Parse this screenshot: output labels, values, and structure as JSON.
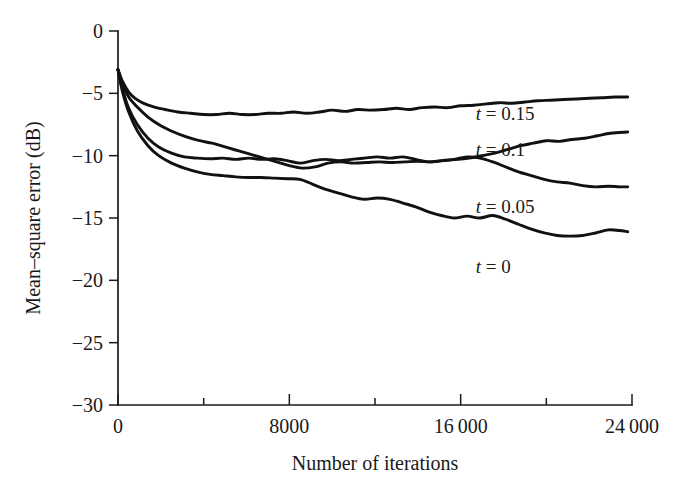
{
  "chart_data": {
    "type": "line",
    "title": "",
    "xlabel": "Number of iterations",
    "ylabel": "Mean–square error (dB)",
    "xlim": [
      0,
      24000
    ],
    "ylim": [
      -30,
      0
    ],
    "grid": false,
    "legend_position": "inline-right",
    "x_ticks": [
      0,
      8000,
      16000,
      24000
    ],
    "x_tick_labels": [
      "0",
      "8000",
      "16 000",
      "24 000"
    ],
    "x_minor_ticks": [
      4000,
      12000,
      20000
    ],
    "y_ticks": [
      0,
      -5,
      -10,
      -15,
      -20,
      -25,
      -30
    ],
    "y_tick_labels": [
      "0",
      "−5",
      "−10",
      "−15",
      "−20",
      "−25",
      "−30"
    ],
    "series": [
      {
        "name": "t = 0.15",
        "label_var": "t",
        "label_eq": "=",
        "label_value": "0.15",
        "label_at": {
          "x": 16700,
          "y": -7.1
        },
        "x": [
          0,
          200,
          500,
          800,
          1200,
          1700,
          2200,
          2800,
          3400,
          4000,
          4600,
          5200,
          5800,
          6400,
          7000,
          7600,
          8200,
          8800,
          9400,
          10000,
          10600,
          11200,
          11800,
          12400,
          13000,
          13600,
          14200,
          14800,
          15400,
          16000,
          16600,
          17200,
          17800,
          18400,
          19000,
          19600,
          20200,
          20800,
          21400,
          22000,
          22600,
          23200,
          23800
        ],
        "y": [
          -3.1,
          -4.0,
          -4.9,
          -5.4,
          -5.8,
          -6.1,
          -6.3,
          -6.5,
          -6.6,
          -6.7,
          -6.7,
          -6.6,
          -6.7,
          -6.7,
          -6.6,
          -6.6,
          -6.5,
          -6.6,
          -6.5,
          -6.35,
          -6.45,
          -6.3,
          -6.35,
          -6.3,
          -6.2,
          -6.3,
          -6.15,
          -6.1,
          -6.15,
          -6.0,
          -5.95,
          -5.85,
          -5.75,
          -5.8,
          -5.7,
          -5.6,
          -5.55,
          -5.5,
          -5.45,
          -5.4,
          -5.35,
          -5.3,
          -5.3
        ]
      },
      {
        "name": "t = 0.1",
        "label_var": "t",
        "label_eq": "=",
        "label_value": "0.1",
        "label_at": {
          "x": 16700,
          "y": -10.0
        },
        "x": [
          0,
          200,
          500,
          900,
          1400,
          2000,
          2600,
          3200,
          3800,
          4400,
          5000,
          5600,
          6200,
          6800,
          7400,
          8000,
          8600,
          9200,
          9800,
          10400,
          11000,
          11600,
          12200,
          12800,
          13400,
          14000,
          14600,
          15200,
          15800,
          16400,
          17000,
          17600,
          18200,
          18800,
          19400,
          20000,
          20600,
          21200,
          21800,
          22400,
          23000,
          23800
        ],
        "y": [
          -3.1,
          -4.2,
          -5.3,
          -6.1,
          -6.9,
          -7.6,
          -8.1,
          -8.5,
          -8.8,
          -9.0,
          -9.3,
          -9.6,
          -9.9,
          -10.2,
          -10.5,
          -10.8,
          -11.0,
          -10.9,
          -10.6,
          -10.5,
          -10.6,
          -10.55,
          -10.5,
          -10.55,
          -10.5,
          -10.45,
          -10.5,
          -10.4,
          -10.3,
          -10.2,
          -10.0,
          -9.8,
          -9.5,
          -9.2,
          -9.0,
          -8.8,
          -8.85,
          -8.7,
          -8.6,
          -8.4,
          -8.2,
          -8.1
        ]
      },
      {
        "name": "t = 0.05",
        "label_var": "t",
        "label_eq": "=",
        "label_value": "0.05",
        "label_at": {
          "x": 16700,
          "y": -14.6
        },
        "x": [
          0,
          200,
          500,
          900,
          1400,
          1900,
          2500,
          3100,
          3700,
          4300,
          4900,
          5500,
          6100,
          6700,
          7300,
          7900,
          8500,
          9100,
          9700,
          10300,
          10900,
          11500,
          12100,
          12700,
          13300,
          13900,
          14500,
          15100,
          15700,
          16300,
          16900,
          17500,
          18100,
          18700,
          19300,
          19900,
          20500,
          21100,
          21700,
          22300,
          22900,
          23400,
          23800
        ],
        "y": [
          -3.1,
          -4.6,
          -6.2,
          -7.5,
          -8.6,
          -9.3,
          -9.8,
          -10.1,
          -10.2,
          -10.25,
          -10.2,
          -10.3,
          -10.2,
          -10.3,
          -10.25,
          -10.4,
          -10.6,
          -10.4,
          -10.3,
          -10.4,
          -10.3,
          -10.2,
          -10.1,
          -10.2,
          -10.1,
          -10.3,
          -10.5,
          -10.4,
          -10.3,
          -10.1,
          -10.2,
          -10.5,
          -10.9,
          -11.3,
          -11.6,
          -11.9,
          -12.1,
          -12.2,
          -12.4,
          -12.5,
          -12.45,
          -12.5,
          -12.5
        ]
      },
      {
        "name": "t = 0",
        "label_var": "t",
        "label_eq": "=",
        "label_value": "0",
        "label_at": {
          "x": 16700,
          "y": -19.4
        },
        "x": [
          0,
          200,
          500,
          900,
          1400,
          1900,
          2500,
          3100,
          3700,
          4300,
          4900,
          5500,
          6100,
          6700,
          7300,
          7900,
          8500,
          9100,
          9700,
          10300,
          10900,
          11500,
          12100,
          12700,
          13300,
          13900,
          14500,
          15100,
          15700,
          16300,
          16900,
          17500,
          18100,
          18700,
          19300,
          19900,
          20500,
          21100,
          21700,
          22300,
          22900,
          23400,
          23800
        ],
        "y": [
          -3.1,
          -4.8,
          -6.5,
          -8.0,
          -9.2,
          -10.0,
          -10.6,
          -11.0,
          -11.3,
          -11.5,
          -11.6,
          -11.7,
          -11.75,
          -11.75,
          -11.8,
          -11.85,
          -11.9,
          -12.3,
          -12.7,
          -13.0,
          -13.3,
          -13.5,
          -13.4,
          -13.5,
          -13.8,
          -14.1,
          -14.5,
          -14.8,
          -15.0,
          -14.85,
          -15.0,
          -14.8,
          -15.1,
          -15.5,
          -15.9,
          -16.2,
          -16.4,
          -16.45,
          -16.4,
          -16.2,
          -15.95,
          -16.0,
          -16.1
        ]
      }
    ]
  },
  "plot_geometry": {
    "left": 118,
    "right": 632,
    "top": 31,
    "bottom": 405
  }
}
